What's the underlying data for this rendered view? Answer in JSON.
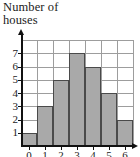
{
  "chart_data": {
    "type": "bar",
    "title": "Number of\nhouses",
    "title_lines": [
      "Number of",
      "houses"
    ],
    "xlabel": "",
    "ylabel": "",
    "categories": [
      "0",
      "1",
      "2",
      "3",
      "4",
      "5",
      "6"
    ],
    "values": [
      1,
      3,
      5,
      7,
      6,
      4,
      2
    ],
    "ylim": [
      0,
      8
    ],
    "y_ticks": [
      1,
      2,
      3,
      4,
      5,
      6,
      7
    ],
    "y_tick_labels": [
      "1",
      "2",
      "3",
      "4",
      "5",
      "6",
      "7"
    ],
    "x_tick_labels": [
      "0",
      "1",
      "2",
      "3",
      "4",
      "5",
      "6"
    ],
    "x_tick_labels_clipped": true,
    "grid": true,
    "legend": false,
    "bars": [
      {
        "category": "0",
        "value": 1
      },
      {
        "category": "1",
        "value": 3
      },
      {
        "category": "2",
        "value": 5
      },
      {
        "category": "3",
        "value": 7
      },
      {
        "category": "4",
        "value": 6
      },
      {
        "category": "5",
        "value": 4
      },
      {
        "category": "6",
        "value": 2
      }
    ],
    "colors": {
      "bar_fill": "#a9a9a9",
      "bar_stroke": "#4a4a4a",
      "grid_line": "#9d9d9d",
      "axis": "#111111",
      "text": "#1b1b1b",
      "background": "#ffffff"
    }
  }
}
